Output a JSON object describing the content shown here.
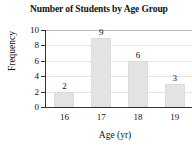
{
  "chart_data": {
    "type": "bar",
    "title": "Number of Students by Age Group",
    "xlabel": "Age (yr)",
    "ylabel": "Frequency",
    "categories": [
      "16",
      "17",
      "18",
      "19"
    ],
    "values": [
      2,
      9,
      6,
      3
    ],
    "value_labels": [
      "2",
      "9",
      "6",
      "3"
    ],
    "ylim": [
      0,
      10
    ],
    "yticks": [
      0,
      2,
      4,
      6,
      8,
      10
    ],
    "ytick_labels": [
      "0",
      "2",
      "4",
      "6",
      "8",
      "10"
    ],
    "grid": "horizontal",
    "legend": "none",
    "bar_color": "#e3e3e3",
    "axis_color": "#333333",
    "grid_color": "#e4e4e4",
    "text_color": "#111111"
  }
}
